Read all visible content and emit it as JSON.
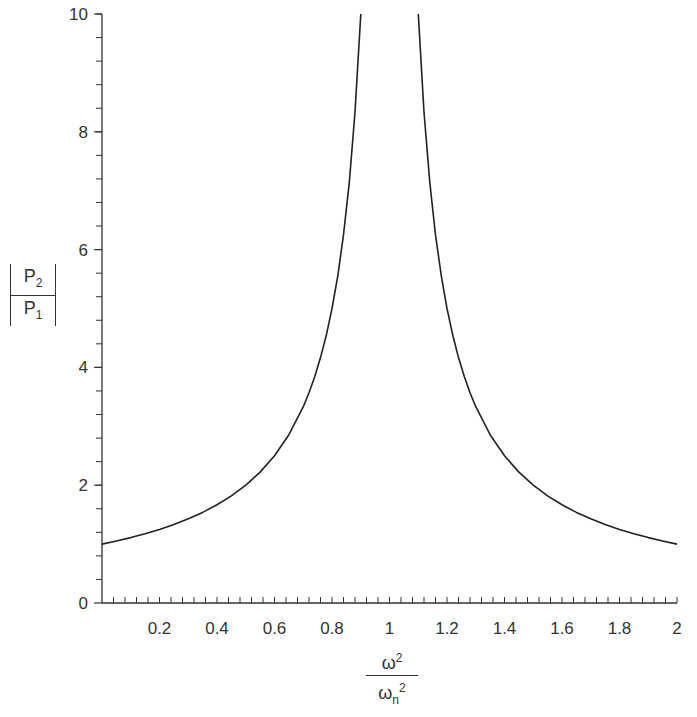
{
  "chart_data": {
    "type": "line",
    "title": "",
    "xlabel": "ω²/ωn²",
    "ylabel": "|P2/P1|",
    "xlim": [
      0,
      2
    ],
    "ylim": [
      0,
      10
    ],
    "grid": false,
    "legend": null,
    "x_ticks": [
      0.2,
      0.4,
      0.6,
      0.8,
      1,
      1.2,
      1.4,
      1.6,
      1.8,
      2
    ],
    "x_tick_labels": [
      "0.2",
      "0.4",
      "0.6",
      "0.8",
      "1",
      "1.2",
      "1.4",
      "1.6",
      "1.8",
      "2"
    ],
    "x_minor_step": 0.04,
    "y_ticks": [
      0,
      2,
      4,
      6,
      8,
      10
    ],
    "y_tick_labels": [
      "0",
      "2",
      "4",
      "6",
      "8",
      "10"
    ],
    "y_minor_step": 0.4,
    "series": [
      {
        "name": "left branch",
        "x": [
          0,
          0.05,
          0.1,
          0.15,
          0.2,
          0.25,
          0.3,
          0.35,
          0.4,
          0.45,
          0.5,
          0.55,
          0.6,
          0.65,
          0.7,
          0.72,
          0.74,
          0.76,
          0.78,
          0.8,
          0.82,
          0.84,
          0.86,
          0.88,
          0.9
        ],
        "y": [
          1.0,
          1.053,
          1.111,
          1.176,
          1.25,
          1.333,
          1.429,
          1.538,
          1.667,
          1.818,
          2.0,
          2.222,
          2.5,
          2.857,
          3.333,
          3.571,
          3.846,
          4.167,
          4.545,
          5.0,
          5.556,
          6.25,
          7.143,
          8.333,
          10.0
        ]
      },
      {
        "name": "right branch",
        "x": [
          1.1,
          1.12,
          1.14,
          1.16,
          1.18,
          1.2,
          1.22,
          1.24,
          1.26,
          1.28,
          1.3,
          1.35,
          1.4,
          1.45,
          1.5,
          1.55,
          1.6,
          1.65,
          1.7,
          1.75,
          1.8,
          1.85,
          1.9,
          1.95,
          2.0
        ],
        "y": [
          10.0,
          8.333,
          7.143,
          6.25,
          5.556,
          5.0,
          4.545,
          4.167,
          3.846,
          3.571,
          3.333,
          2.857,
          2.5,
          2.222,
          2.0,
          1.818,
          1.667,
          1.538,
          1.429,
          1.333,
          1.25,
          1.176,
          1.111,
          1.053,
          1.0
        ]
      }
    ],
    "line_color": "#222222"
  },
  "labels": {
    "y_num": "P",
    "y_num_sub": "2",
    "y_den": "P",
    "y_den_sub": "1",
    "x_num": "ω",
    "x_num_sup": "2",
    "x_den": "ω",
    "x_den_sub": "n",
    "x_den_sup": "2"
  }
}
